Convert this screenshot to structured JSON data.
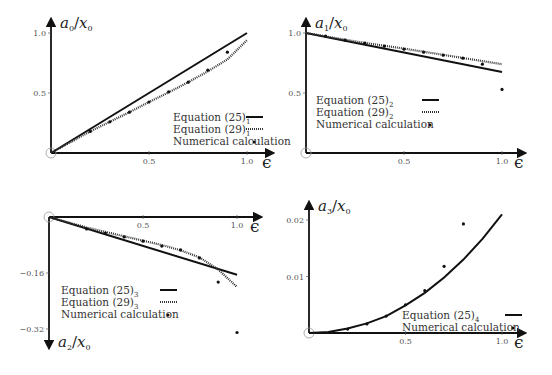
{
  "chart_data": [
    {
      "id": "p1",
      "type": "line",
      "title": "",
      "ylabel": "a_0/x_0",
      "ylabel_main": "a",
      "ylabel_sub": "0",
      "ylabel_den": "x",
      "ylabel_den_sub": "0",
      "xlabel": "ϵ",
      "xlim": [
        0,
        1.0
      ],
      "ylim": [
        0,
        1.0
      ],
      "xticks": [
        0.5,
        1.0
      ],
      "xtick_labels": [
        "0.5",
        "1.0"
      ],
      "yticks": [
        0.5,
        1.0
      ],
      "ytick_labels": [
        "0.5",
        "1.0"
      ],
      "grid": false,
      "legend_position": "lower right",
      "frame": {
        "x0": 51,
        "y0": 153,
        "xscale": 196,
        "yscale": 120,
        "ytop": 22,
        "xright": 270,
        "xaxis_y": 153,
        "yaxis_dir": "up"
      },
      "legend": {
        "x": 173,
        "y": 117,
        "swatch_x": 246,
        "rows": 3
      },
      "series": [
        {
          "name": "Equation (25)",
          "sub": "1",
          "style": "solid",
          "x": [
            0,
            0.25,
            0.5,
            0.75,
            1.0
          ],
          "y": [
            0,
            0.25,
            0.5,
            0.75,
            1.0
          ]
        },
        {
          "name": "Equation (29)",
          "sub": "1",
          "style": "dotted",
          "x": [
            0,
            0.1,
            0.2,
            0.3,
            0.4,
            0.5,
            0.6,
            0.7,
            0.8,
            0.9,
            1.0
          ],
          "y": [
            0,
            0.09,
            0.18,
            0.26,
            0.34,
            0.425,
            0.505,
            0.59,
            0.68,
            0.78,
            0.94
          ]
        },
        {
          "name": "Numerical calculation",
          "sub": "",
          "style": "points",
          "x": [
            0.2,
            0.3,
            0.4,
            0.5,
            0.6,
            0.7,
            0.8,
            0.9
          ],
          "y": [
            0.18,
            0.26,
            0.34,
            0.425,
            0.51,
            0.59,
            0.69,
            0.84
          ]
        }
      ]
    },
    {
      "id": "p2",
      "type": "line",
      "title": "",
      "ylabel": "a_1/x_0",
      "ylabel_main": "a",
      "ylabel_sub": "1",
      "ylabel_den": "x",
      "ylabel_den_sub": "0",
      "xlabel": "ϵ",
      "xlim": [
        0,
        1.0
      ],
      "ylim": [
        0,
        1.0
      ],
      "xticks": [
        0.5,
        1.0
      ],
      "xtick_labels": [
        "0.5",
        "1.0"
      ],
      "yticks": [
        0.5,
        1.0
      ],
      "ytick_labels": [
        "0.5",
        "1.0"
      ],
      "grid": false,
      "legend_position": "center left",
      "frame": {
        "x0": 306,
        "y0": 153,
        "xscale": 196,
        "yscale": 120,
        "ytop": 22,
        "xright": 522,
        "xaxis_y": 153,
        "yaxis_dir": "up"
      },
      "legend": {
        "x": 316,
        "y": 100,
        "swatch_x": 422,
        "rows": 3
      },
      "series": [
        {
          "name": "Equation (25)",
          "sub": "2",
          "style": "solid",
          "x": [
            0,
            1.0
          ],
          "y": [
            1.0,
            0.675
          ]
        },
        {
          "name": "Equation (29)",
          "sub": "2",
          "style": "dotted",
          "x": [
            0,
            0.25,
            0.5,
            0.75,
            1.0
          ],
          "y": [
            1.0,
            0.93,
            0.87,
            0.805,
            0.74
          ]
        },
        {
          "name": "Numerical calculation",
          "sub": "",
          "style": "points",
          "x": [
            0.1,
            0.2,
            0.3,
            0.4,
            0.5,
            0.6,
            0.7,
            0.8,
            0.9,
            1.0
          ],
          "y": [
            0.975,
            0.94,
            0.915,
            0.89,
            0.865,
            0.84,
            0.815,
            0.79,
            0.74,
            0.53
          ]
        }
      ]
    },
    {
      "id": "p3",
      "type": "line",
      "title": "",
      "ylabel": "a_2/x_0",
      "ylabel_main": "a",
      "ylabel_sub": "2",
      "ylabel_den": "x",
      "ylabel_den_sub": "0",
      "xlabel": "ϵ",
      "xlim": [
        0,
        1.0
      ],
      "ylim": [
        -0.32,
        0
      ],
      "xticks": [
        0.5,
        1.0
      ],
      "xtick_labels": [
        "0.5",
        "1.0"
      ],
      "yticks": [
        -0.16,
        -0.32
      ],
      "ytick_labels": [
        "−0.16",
        "−0.32"
      ],
      "grid": false,
      "legend_position": "lower left",
      "frame": {
        "x0": 49,
        "y0": 217,
        "xscale": 188,
        "yscale": 350,
        "ytop": 345,
        "xright": 258,
        "xaxis_y": 217,
        "yaxis_dir": "down"
      },
      "legend": {
        "x": 61,
        "y": 290,
        "swatch_x": 160,
        "rows": 3
      },
      "series": [
        {
          "name": "Equation (25)",
          "sub": "3",
          "style": "solid",
          "x": [
            0,
            1.0
          ],
          "y": [
            0,
            -0.165
          ]
        },
        {
          "name": "Equation (29)",
          "sub": "3",
          "style": "dotted",
          "x": [
            0,
            0.2,
            0.4,
            0.6,
            0.7,
            0.8,
            0.9,
            1.0
          ],
          "y": [
            0,
            -0.03,
            -0.055,
            -0.08,
            -0.095,
            -0.115,
            -0.15,
            -0.2
          ]
        },
        {
          "name": "Numerical calculation",
          "sub": "",
          "style": "points",
          "x": [
            0.2,
            0.3,
            0.4,
            0.5,
            0.6,
            0.7,
            0.8,
            0.9,
            1.0
          ],
          "y": [
            -0.034,
            -0.046,
            -0.057,
            -0.069,
            -0.083,
            -0.094,
            -0.117,
            -0.186,
            -0.33
          ]
        }
      ]
    },
    {
      "id": "p4",
      "type": "line",
      "title": "",
      "ylabel": "a_3/x_0",
      "ylabel_main": "a",
      "ylabel_sub": "3",
      "ylabel_den": "x",
      "ylabel_den_sub": "0",
      "xlabel": "ϵ",
      "xlim": [
        0,
        1.0
      ],
      "ylim": [
        0,
        0.02
      ],
      "xticks": [
        0.5,
        1.0
      ],
      "xtick_labels": [
        "0.5",
        "1.0"
      ],
      "yticks": [
        0.01,
        0.02
      ],
      "ytick_labels": [
        "0.01",
        "0.02"
      ],
      "grid": false,
      "legend_position": "lower right",
      "frame": {
        "x0": 309,
        "y0": 333,
        "xscale": 193,
        "yscale": 5650,
        "ytop": 205,
        "xright": 522,
        "xaxis_y": 333,
        "yaxis_dir": "up"
      },
      "legend": {
        "x": 402,
        "y": 315,
        "swatch_x": 505,
        "rows": 2
      },
      "series": [
        {
          "name": "Equation (25)",
          "sub": "4",
          "style": "solid",
          "x": [
            0,
            0.1,
            0.2,
            0.3,
            0.4,
            0.5,
            0.6,
            0.7,
            0.8,
            0.9,
            1.0
          ],
          "y": [
            0,
            0.0002,
            0.0008,
            0.0017,
            0.003,
            0.0049,
            0.0071,
            0.0098,
            0.013,
            0.0167,
            0.021
          ]
        },
        {
          "name": "Numerical calculation",
          "sub": "",
          "style": "points",
          "x": [
            0.2,
            0.3,
            0.4,
            0.5,
            0.6,
            0.7,
            0.8
          ],
          "y": [
            0.0007,
            0.0016,
            0.003,
            0.005,
            0.0075,
            0.0118,
            0.0193
          ]
        }
      ]
    }
  ]
}
